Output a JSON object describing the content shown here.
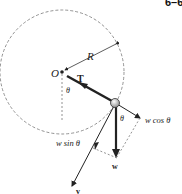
{
  "figure": {
    "number": "6–6",
    "labels": {
      "center": "O",
      "radius": "R",
      "tension": "T",
      "theta_top": "θ",
      "theta_ball": "θ",
      "w_cos": "w cos θ",
      "w_sin": "w sin θ",
      "weight": "w",
      "velocity": "v"
    },
    "geometry": {
      "center": [
        62,
        72
      ],
      "radius": 62,
      "ball": [
        115,
        103
      ]
    },
    "colors": {
      "line": "#222222",
      "dashed": "#777777",
      "ball": "#cccccc"
    }
  }
}
